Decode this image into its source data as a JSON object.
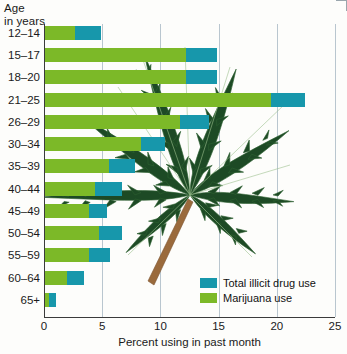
{
  "chart_data": {
    "type": "bar",
    "orientation": "horizontal",
    "stacked_overlay": true,
    "title": "",
    "ylabel": "Age in years",
    "xlabel": "Percent using in past month",
    "xlim": [
      0,
      25
    ],
    "xticks": [
      0,
      5,
      10,
      15,
      20,
      25
    ],
    "grid": true,
    "legend_position": "inside-bottom-right",
    "categories": [
      "12–14",
      "15–17",
      "18–20",
      "21–25",
      "26–29",
      "30–34",
      "35–39",
      "40–44",
      "45–49",
      "50–54",
      "55–59",
      "60–64",
      "65+"
    ],
    "series": [
      {
        "name": "Total illicit drug use",
        "color": "#1797ab",
        "values": [
          4.9,
          14.9,
          14.9,
          22.4,
          14.2,
          10.4,
          7.8,
          6.7,
          5.4,
          6.7,
          5.7,
          3.4,
          1.0
        ]
      },
      {
        "name": "Marijuana use",
        "color": "#7cb928",
        "values": [
          2.7,
          12.2,
          12.2,
          19.5,
          11.7,
          8.3,
          5.6,
          4.4,
          3.9,
          4.7,
          3.9,
          2.0,
          0.4
        ]
      }
    ]
  },
  "axis": {
    "y_title_line1": "Age",
    "y_title_line2": "in years",
    "x_title": "Percent using in past month",
    "x_tick_labels": [
      "0",
      "5",
      "10",
      "15",
      "20",
      "25"
    ]
  },
  "legend": {
    "items": [
      {
        "label": "Total illicit drug use",
        "color": "#1797ab"
      },
      {
        "label": "Marijuana use",
        "color": "#7cb928"
      }
    ]
  },
  "artwork": {
    "leaf_name": "cannabis-leaf",
    "leaf_color": "#1d4a25",
    "stem_color": "#9a6a3c"
  },
  "colors": {
    "total_illicit": "#1797ab",
    "marijuana": "#7cb928",
    "grid": "#b9c6cf",
    "axis": "#3b3b3b",
    "text": "#1a1a1a",
    "background": "#fdfdfb"
  }
}
